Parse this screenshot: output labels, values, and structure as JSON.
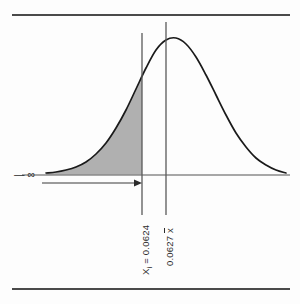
{
  "figure": {
    "title": "",
    "annotations": {
      "neg_infinity": "— ∞",
      "xi_label": "Xᵢ = 0.0624",
      "xi_symbol": "X",
      "xi_subscript": "i",
      "xi_equals": "=",
      "xi_value": "0.0624",
      "xbar_label": "0.0627 x̄",
      "xbar_symbol": "x",
      "xbar_value": "0.0627"
    },
    "colors": {
      "curve": "#1a1a1a",
      "shade_fill": "#b0b0b0",
      "axis": "#8a8a8a",
      "rule": "#4a4a4a",
      "vline": "#5a5a5a",
      "background": "#fdfdfd",
      "text": "#2b2b2b"
    }
  },
  "chart_data": {
    "type": "area",
    "title": "",
    "subtitle": "",
    "xlabel": "",
    "ylabel": "",
    "grid": false,
    "legend": null,
    "distribution": "normal",
    "mean": 0.0627,
    "mean_pixel_x": 166,
    "threshold": 0.0624,
    "threshold_pixel_x": 142,
    "shaded_region": {
      "from": "-infinity",
      "to": 0.0624,
      "fill": "#b0b0b0",
      "meaning": "cumulative probability P(X ≤ 0.0624)"
    },
    "axis_baseline_y": 175,
    "peak_y": 38,
    "x_domain_pixels": [
      46,
      290
    ],
    "tick_labels": [
      "Xᵢ = 0.0624",
      "0.0627 x̄"
    ],
    "tick_values": [
      0.0624,
      0.0627
    ],
    "annotations": [
      {
        "text": "— ∞",
        "type": "arrow-label",
        "direction": "right",
        "from_x": 46,
        "to_x": 142,
        "y": 183
      }
    ],
    "curve_points_pixels": [
      [
        46,
        173
      ],
      [
        56,
        172
      ],
      [
        66,
        170
      ],
      [
        76,
        167
      ],
      [
        86,
        162
      ],
      [
        96,
        154
      ],
      [
        106,
        143
      ],
      [
        116,
        128
      ],
      [
        126,
        110
      ],
      [
        136,
        89
      ],
      [
        146,
        68
      ],
      [
        156,
        50
      ],
      [
        166,
        40
      ],
      [
        176,
        38
      ],
      [
        186,
        44
      ],
      [
        196,
        57
      ],
      [
        206,
        75
      ],
      [
        216,
        95
      ],
      [
        226,
        115
      ],
      [
        236,
        133
      ],
      [
        246,
        147
      ],
      [
        256,
        158
      ],
      [
        266,
        165
      ],
      [
        276,
        170
      ],
      [
        286,
        173
      ]
    ]
  }
}
